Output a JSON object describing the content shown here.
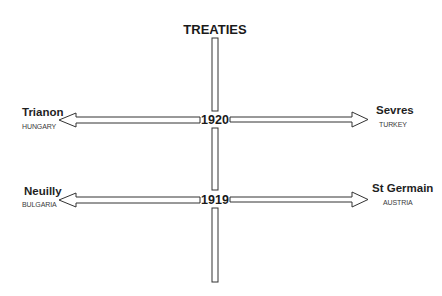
{
  "title": "TREATIES",
  "timeline": {
    "years": [
      {
        "year": "1920",
        "left": {
          "treaty": "Trianon",
          "country": "HUNGARY"
        },
        "right": {
          "treaty": "Sevres",
          "country": "TURKEY"
        }
      },
      {
        "year": "1919",
        "left": {
          "treaty": "Neuilly",
          "country": "BULGARIA"
        },
        "right": {
          "treaty": "St Germain",
          "country": "AUSTRIA"
        }
      }
    ]
  },
  "colors": {
    "line": "#333333",
    "text": "#1a1a1a",
    "background": "#ffffff"
  }
}
